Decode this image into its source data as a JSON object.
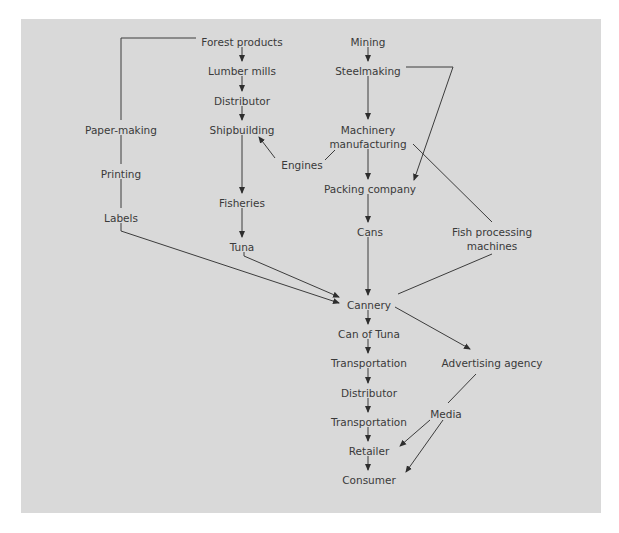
{
  "diagram": {
    "colors": {
      "background": "#d9d9d9",
      "text": "#3a3a3a",
      "line": "#3c3c3c"
    },
    "nodes": [
      {
        "id": "forest_products",
        "label": "Forest products",
        "x": 242,
        "y": 42
      },
      {
        "id": "lumber_mills",
        "label": "Lumber mills",
        "x": 242,
        "y": 71
      },
      {
        "id": "distributor_1",
        "label": "Distributor",
        "x": 242,
        "y": 101
      },
      {
        "id": "shipbuilding",
        "label": "Shipbuilding",
        "x": 242,
        "y": 130
      },
      {
        "id": "fisheries",
        "label": "Fisheries",
        "x": 242,
        "y": 203
      },
      {
        "id": "tuna",
        "label": "Tuna",
        "x": 242,
        "y": 247
      },
      {
        "id": "mining",
        "label": "Mining",
        "x": 368,
        "y": 42
      },
      {
        "id": "steelmaking",
        "label": "Steelmaking",
        "x": 368,
        "y": 71
      },
      {
        "id": "machinery_1",
        "label": "Machinery",
        "x": 368,
        "y": 130
      },
      {
        "id": "machinery_2",
        "label": "manufacturing",
        "x": 368,
        "y": 144
      },
      {
        "id": "engines",
        "label": "Engines",
        "x": 302,
        "y": 165
      },
      {
        "id": "packing_company",
        "label": "Packing company",
        "x": 370,
        "y": 189
      },
      {
        "id": "cans",
        "label": "Cans",
        "x": 370,
        "y": 232
      },
      {
        "id": "fish_machines_1",
        "label": "Fish processing",
        "x": 492,
        "y": 232
      },
      {
        "id": "fish_machines_2",
        "label": "machines",
        "x": 492,
        "y": 246
      },
      {
        "id": "paper_making",
        "label": "Paper-making",
        "x": 121,
        "y": 130
      },
      {
        "id": "printing",
        "label": "Printing",
        "x": 121,
        "y": 174
      },
      {
        "id": "labels",
        "label": "Labels",
        "x": 121,
        "y": 218
      },
      {
        "id": "cannery",
        "label": "Cannery",
        "x": 369,
        "y": 305
      },
      {
        "id": "can_of_tuna",
        "label": "Can of Tuna",
        "x": 369,
        "y": 334
      },
      {
        "id": "transportation_1",
        "label": "Transportation",
        "x": 369,
        "y": 363
      },
      {
        "id": "distributor_2",
        "label": "Distributor",
        "x": 369,
        "y": 393
      },
      {
        "id": "transportation_2",
        "label": "Transportation",
        "x": 369,
        "y": 422
      },
      {
        "id": "retailer",
        "label": "Retailer",
        "x": 369,
        "y": 451
      },
      {
        "id": "consumer",
        "label": "Consumer",
        "x": 369,
        "y": 480
      },
      {
        "id": "advertising_agency",
        "label": "Advertising agency",
        "x": 492,
        "y": 363
      },
      {
        "id": "media",
        "label": "Media",
        "x": 446,
        "y": 414
      }
    ],
    "edges": [
      {
        "from": "forest_products",
        "to": "lumber_mills",
        "points": [
          [
            242,
            47
          ],
          [
            242,
            61
          ]
        ],
        "arrow": true
      },
      {
        "from": "lumber_mills",
        "to": "distributor_1",
        "points": [
          [
            242,
            76
          ],
          [
            242,
            91
          ]
        ],
        "arrow": true
      },
      {
        "from": "distributor_1",
        "to": "shipbuilding",
        "points": [
          [
            242,
            106
          ],
          [
            242,
            120
          ]
        ],
        "arrow": true
      },
      {
        "from": "shipbuilding",
        "to": "fisheries",
        "points": [
          [
            242,
            135
          ],
          [
            242,
            193
          ]
        ],
        "arrow": true
      },
      {
        "from": "fisheries",
        "to": "tuna",
        "points": [
          [
            242,
            208
          ],
          [
            242,
            237
          ]
        ],
        "arrow": true
      },
      {
        "from": "engines",
        "to": "shipbuilding",
        "points": [
          [
            275,
            158
          ],
          [
            259,
            137
          ]
        ],
        "arrow": true
      },
      {
        "from": "machinery_manufacturing",
        "to": "engines",
        "points": [
          [
            325,
            160
          ],
          [
            335,
            150
          ]
        ],
        "arrow": false
      },
      {
        "from": "forest_products",
        "to": "paper_making",
        "points": [
          [
            196,
            38
          ],
          [
            121,
            38
          ],
          [
            121,
            120
          ]
        ],
        "arrow": false
      },
      {
        "from": "paper_making",
        "to": "printing",
        "points": [
          [
            121,
            135
          ],
          [
            121,
            164
          ]
        ],
        "arrow": false
      },
      {
        "from": "printing",
        "to": "labels",
        "points": [
          [
            121,
            179
          ],
          [
            121,
            208
          ]
        ],
        "arrow": false
      },
      {
        "from": "labels",
        "to": "cannery",
        "points": [
          [
            121,
            223
          ],
          [
            121,
            231
          ],
          [
            339,
            303
          ]
        ],
        "arrow": true
      },
      {
        "from": "tuna",
        "to": "cannery",
        "points": [
          [
            244,
            252
          ],
          [
            244,
            256
          ],
          [
            339,
            297
          ]
        ],
        "arrow": true
      },
      {
        "from": "mining",
        "to": "steelmaking",
        "points": [
          [
            368,
            47
          ],
          [
            368,
            61
          ]
        ],
        "arrow": true
      },
      {
        "from": "steelmaking",
        "to": "machinery_manufacturing",
        "points": [
          [
            368,
            76
          ],
          [
            368,
            119
          ]
        ],
        "arrow": true
      },
      {
        "from": "steelmaking",
        "to": "packing_company",
        "points": [
          [
            406,
            67
          ],
          [
            453,
            67
          ],
          [
            414,
            180
          ]
        ],
        "arrow": true
      },
      {
        "from": "machinery_manufacturing",
        "to": "packing_company",
        "points": [
          [
            368,
            149
          ],
          [
            368,
            179
          ]
        ],
        "arrow": true
      },
      {
        "from": "machinery_manufacturing",
        "to": "fish_processing_machines",
        "points": [
          [
            413,
            144
          ],
          [
            492,
            222
          ]
        ],
        "arrow": false
      },
      {
        "from": "packing_company",
        "to": "cans",
        "points": [
          [
            368,
            194
          ],
          [
            368,
            222
          ]
        ],
        "arrow": true
      },
      {
        "from": "cans",
        "to": "cannery",
        "points": [
          [
            368,
            237
          ],
          [
            368,
            295
          ]
        ],
        "arrow": true
      },
      {
        "from": "fish_processing_machines",
        "to": "cannery",
        "points": [
          [
            492,
            254
          ],
          [
            398,
            294
          ]
        ],
        "arrow": false
      },
      {
        "from": "cannery",
        "to": "can_of_tuna",
        "points": [
          [
            368,
            310
          ],
          [
            368,
            324
          ]
        ],
        "arrow": true
      },
      {
        "from": "cannery",
        "to": "advertising_agency",
        "points": [
          [
            395,
            307
          ],
          [
            470,
            349
          ]
        ],
        "arrow": true
      },
      {
        "from": "can_of_tuna",
        "to": "transportation_1",
        "points": [
          [
            368,
            339
          ],
          [
            368,
            353
          ]
        ],
        "arrow": true
      },
      {
        "from": "transportation_1",
        "to": "distributor_2",
        "points": [
          [
            368,
            368
          ],
          [
            368,
            383
          ]
        ],
        "arrow": true
      },
      {
        "from": "distributor_2",
        "to": "transportation_2",
        "points": [
          [
            368,
            398
          ],
          [
            368,
            412
          ]
        ],
        "arrow": true
      },
      {
        "from": "transportation_2",
        "to": "retailer",
        "points": [
          [
            368,
            427
          ],
          [
            368,
            441
          ]
        ],
        "arrow": true
      },
      {
        "from": "retailer",
        "to": "consumer",
        "points": [
          [
            368,
            456
          ],
          [
            368,
            470
          ]
        ],
        "arrow": true
      },
      {
        "from": "advertising_agency",
        "to": "media",
        "points": [
          [
            476,
            374
          ],
          [
            448,
            403
          ]
        ],
        "arrow": false
      },
      {
        "from": "media",
        "to": "retailer",
        "points": [
          [
            430,
            420
          ],
          [
            400,
            446
          ]
        ],
        "arrow": true
      },
      {
        "from": "media",
        "to": "consumer",
        "points": [
          [
            443,
            420
          ],
          [
            406,
            472
          ]
        ],
        "arrow": true
      }
    ]
  }
}
